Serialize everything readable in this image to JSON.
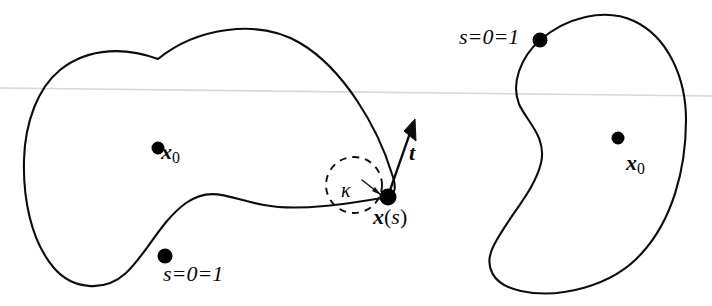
{
  "figure": {
    "background_color": "#ffffff",
    "stroke_color": "#0d0d0d",
    "horizon_color": "#d8d8d8",
    "width": 712,
    "height": 306
  },
  "labels": {
    "x0_left": {
      "symbol": "x",
      "subscript": "0"
    },
    "x0_right": {
      "symbol": "x",
      "subscript": "0"
    },
    "x_of_s": {
      "symbol": "x",
      "open_paren": "(",
      "arg": "s",
      "close_paren": ")"
    },
    "tangent": {
      "symbol": "t"
    },
    "curvature": {
      "symbol": "κ"
    },
    "start_point_left": {
      "text": "s=0=1"
    },
    "start_point_right": {
      "text": "s=0=1"
    }
  },
  "shapes": {
    "left_curve": {
      "name": "left-closed-curve",
      "path": "M 158 59 C 196 28 258 18 300 43 C 344 69 378 128 392 174 C 397 188 395 194 388 197 C 352 203 300 212 264 205 C 230 199 212 185 186 203 C 160 222 148 252 126 273 C 104 293 72 289 54 268 C 30 240 23 196 24 160 C 25 122 38 88 60 70 C 90 46 128 48 158 59 Z"
    },
    "right_curve": {
      "name": "right-closed-curve",
      "path": "M 540 40 C 566 18 604 7 634 21 C 668 37 686 78 686 120 C 686 170 672 220 642 253 C 612 287 558 299 521 291 C 492 285 483 266 494 245 C 508 217 534 192 541 163 C 547 137 527 122 519 104 C 511 84 520 58 540 40 Z"
    },
    "osculating_circle": {
      "name": "osculating-circle",
      "cx": 354,
      "cy": 185,
      "r": 28
    },
    "tangent_vector": {
      "name": "tangent-arrow",
      "from": [
        388,
        196
      ],
      "to": [
        414,
        122
      ]
    },
    "horizon_line": {
      "name": "horizon-line",
      "from": [
        0,
        88
      ],
      "to": [
        712,
        96
      ]
    }
  },
  "points": [
    {
      "name": "point-x0-left",
      "cx": 158,
      "cy": 148,
      "r": 6.5
    },
    {
      "name": "point-x0-right",
      "cx": 618,
      "cy": 138,
      "r": 6.5
    },
    {
      "name": "point-x-of-s",
      "cx": 388,
      "cy": 197,
      "r": 8.5
    },
    {
      "name": "point-s0-left",
      "cx": 165,
      "cy": 256,
      "r": 7.5
    },
    {
      "name": "point-s0-right",
      "cx": 540,
      "cy": 40,
      "r": 7.5
    }
  ]
}
